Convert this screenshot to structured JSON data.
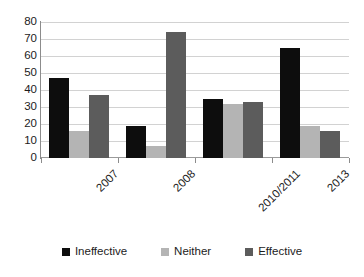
{
  "chart_data": {
    "type": "bar",
    "title": "",
    "subtitle": "",
    "xlabel": "",
    "ylabel": "",
    "categories": [
      "2007",
      "2008",
      "2010/2011",
      "2013"
    ],
    "series": [
      {
        "name": "Ineffective",
        "color": "#0d0d0d",
        "values": [
          47,
          19,
          35,
          65
        ]
      },
      {
        "name": "Neither",
        "color": "#b4b4b4",
        "values": [
          16,
          7,
          32,
          19
        ]
      },
      {
        "name": "Effective",
        "color": "#5c5c5c",
        "values": [
          37,
          74,
          33,
          16
        ]
      }
    ],
    "ylim": [
      0,
      80
    ],
    "ytick_step": 10,
    "yticks": [
      "80",
      "70",
      "60",
      "50",
      "40",
      "30",
      "20",
      "10",
      "0"
    ],
    "grid": true,
    "legend_position": "bottom",
    "annotations": []
  },
  "legend": {
    "items": [
      {
        "label": "Ineffective",
        "color": "#0d0d0d"
      },
      {
        "label": "Neither",
        "color": "#b4b4b4"
      },
      {
        "label": "Effective",
        "color": "#5c5c5c"
      }
    ]
  }
}
